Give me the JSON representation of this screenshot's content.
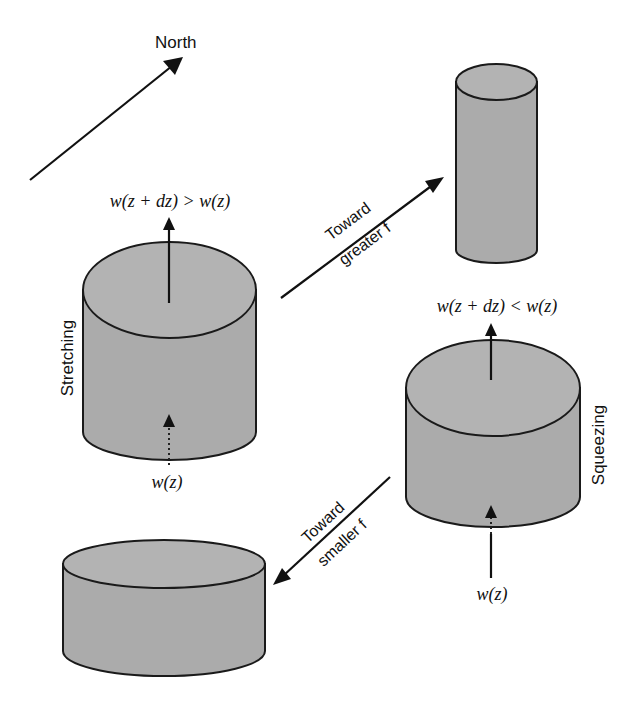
{
  "diagram": {
    "compass": {
      "label": "North"
    },
    "stretching_column": {
      "side_label": "Stretching",
      "top_relation": "w(z + dz) > w(z)",
      "bottom_label": "w(z)"
    },
    "tall_column": {},
    "squeezing_column": {
      "side_label": "Squeezing",
      "top_relation": "w(z + dz) < w(z)",
      "bottom_label": "w(z)"
    },
    "flat_column": {},
    "arrow_greater_f": {
      "line1": "Toward",
      "line2": "greater f"
    },
    "arrow_smaller_f": {
      "line1": "Toward",
      "line2": "smaller f"
    },
    "colors": {
      "column_fill": "#ababab",
      "stroke": "#1a1a1a",
      "background": "#ffffff"
    }
  }
}
